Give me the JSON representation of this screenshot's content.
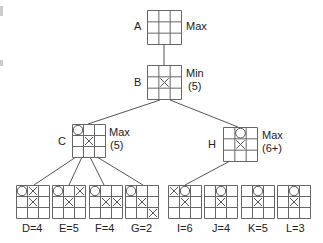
{
  "diagram": {
    "type": "minimax game tree (tic-tac-toe)",
    "nodes": [
      {
        "id": "A",
        "name": "A",
        "role": "Max",
        "value": "",
        "x": 147,
        "y": 10,
        "size": 34,
        "cells": [
          "",
          "",
          "",
          "",
          "",
          "",
          "",
          "",
          ""
        ],
        "name_pos": [
          134,
          20
        ],
        "role_pos": [
          186,
          20
        ],
        "value_pos": null
      },
      {
        "id": "B",
        "name": "B",
        "role": "Min",
        "value": "(5)",
        "x": 147,
        "y": 65,
        "size": 34,
        "cells": [
          "",
          "",
          "",
          "",
          "X",
          "",
          "",
          "",
          ""
        ],
        "name_pos": [
          134,
          76
        ],
        "role_pos": [
          186,
          67
        ],
        "value_pos": [
          188,
          80
        ]
      },
      {
        "id": "C",
        "name": "C",
        "role": "Max",
        "value": "(5)",
        "x": 72,
        "y": 124,
        "size": 33,
        "cells": [
          "O",
          "",
          "",
          "",
          "X",
          "",
          "",
          "",
          ""
        ],
        "name_pos": [
          58,
          135
        ],
        "role_pos": [
          109,
          126
        ],
        "value_pos": [
          110,
          139
        ]
      },
      {
        "id": "H",
        "name": "H",
        "role": "Max",
        "value": "(6+)",
        "x": 223,
        "y": 127,
        "size": 34,
        "cells": [
          "",
          "O",
          "",
          "",
          "X",
          "",
          "",
          "",
          ""
        ],
        "name_pos": [
          208,
          138
        ],
        "role_pos": [
          262,
          129
        ],
        "value_pos": [
          262,
          142
        ]
      },
      {
        "id": "D",
        "label": "D=4",
        "x": 16,
        "y": 185,
        "size": 33,
        "cells": [
          "O",
          "X",
          "",
          "",
          "X",
          "",
          "",
          "",
          ""
        ],
        "label_pos": [
          22,
          222
        ]
      },
      {
        "id": "E",
        "label": "E=5",
        "x": 52,
        "y": 185,
        "size": 33,
        "cells": [
          "O",
          "",
          "X",
          "",
          "X",
          "",
          "",
          "",
          ""
        ],
        "label_pos": [
          59,
          222
        ]
      },
      {
        "id": "F",
        "label": "F=4",
        "x": 89,
        "y": 185,
        "size": 33,
        "cells": [
          "O",
          "",
          "",
          "",
          "X",
          "X",
          "",
          "",
          ""
        ],
        "label_pos": [
          95,
          222
        ]
      },
      {
        "id": "G",
        "label": "G=2",
        "x": 125,
        "y": 185,
        "size": 33,
        "cells": [
          "O",
          "",
          "",
          "",
          "X",
          "",
          "",
          "",
          "X"
        ],
        "label_pos": [
          131,
          222
        ]
      },
      {
        "id": "I",
        "label": "I=6",
        "x": 168,
        "y": 185,
        "size": 33,
        "cells": [
          "X",
          "O",
          "",
          "",
          "X",
          "",
          "",
          "",
          ""
        ],
        "label_pos": [
          177,
          222
        ]
      },
      {
        "id": "J",
        "label": "J=4",
        "x": 204,
        "y": 185,
        "size": 33,
        "cells": [
          "",
          "O",
          "",
          "",
          "X",
          "",
          "",
          "",
          ""
        ],
        "label_pos": [
          212,
          222
        ]
      },
      {
        "id": "K",
        "label": "K=5",
        "x": 241,
        "y": 185,
        "size": 33,
        "cells": [
          "",
          "O",
          "",
          "",
          "X",
          "",
          "",
          "",
          ""
        ],
        "label_pos": [
          248,
          222
        ]
      },
      {
        "id": "L",
        "label": "L=3",
        "x": 277,
        "y": 185,
        "size": 33,
        "cells": [
          "",
          "O",
          "",
          "",
          "X",
          "",
          "",
          "",
          ""
        ],
        "label_pos": [
          286,
          222
        ]
      }
    ],
    "edges": [
      {
        "from": "A",
        "to": "B",
        "x1": 164,
        "y1": 44,
        "x2": 164,
        "y2": 65
      },
      {
        "from": "B",
        "to": "C",
        "x1": 160,
        "y1": 100,
        "x2": 88,
        "y2": 124
      },
      {
        "from": "B",
        "to": "H",
        "x1": 170,
        "y1": 100,
        "x2": 238,
        "y2": 127
      },
      {
        "from": "C",
        "to": "D",
        "x1": 76,
        "y1": 157,
        "x2": 34,
        "y2": 185
      },
      {
        "from": "C",
        "to": "E",
        "x1": 82,
        "y1": 157,
        "x2": 69,
        "y2": 185
      },
      {
        "from": "C",
        "to": "F",
        "x1": 90,
        "y1": 157,
        "x2": 104,
        "y2": 185
      },
      {
        "from": "C",
        "to": "G",
        "x1": 97,
        "y1": 157,
        "x2": 143,
        "y2": 185
      },
      {
        "from": "H",
        "to": "I",
        "x1": 230,
        "y1": 161,
        "x2": 185,
        "y2": 185
      }
    ],
    "colors": {
      "line": "#555555",
      "grid": "#666666",
      "mark": "#555555",
      "text": "#222222",
      "background": "#ffffff"
    }
  }
}
